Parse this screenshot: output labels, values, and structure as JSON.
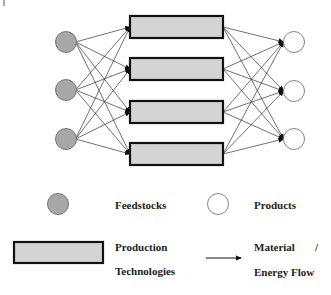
{
  "diagram": {
    "feedstocks": [
      {
        "id": "F1"
      },
      {
        "id": "F2"
      },
      {
        "id": "F3"
      }
    ],
    "technologies": [
      {
        "id": "T1"
      },
      {
        "id": "T2"
      },
      {
        "id": "T3"
      },
      {
        "id": "T4"
      }
    ],
    "products": [
      {
        "id": "P1"
      },
      {
        "id": "P2"
      },
      {
        "id": "P3"
      }
    ],
    "connections": "fully connected: every feedstock to every technology, every technology to every product"
  },
  "legend": {
    "feedstocks": "Feedstocks",
    "products": "Products",
    "technologies_line1": "Production",
    "technologies_line2": "Technologies",
    "flow_line1": "Material",
    "flow_slash": "/",
    "flow_line2": "Energy Flow"
  },
  "colors": {
    "feedstock_fill": "#a8a8a8",
    "feedstock_stroke": "#777777",
    "technology_fill": "#d4d4d4",
    "technology_stroke": "#111111",
    "product_fill": "#ffffff",
    "product_stroke": "#888888",
    "edge": "#333333"
  }
}
